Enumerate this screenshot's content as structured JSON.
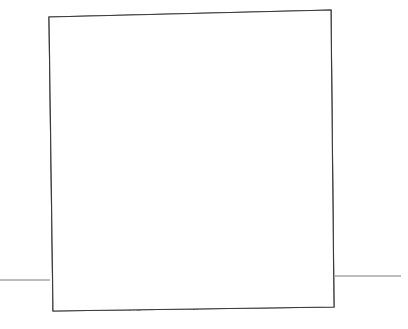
{
  "drawing": {
    "title": "Perspective line sketch of a two-part wall panel",
    "description": "Freehand technical sketch: an upright rectangular panel drawn in slight perspective. The left half is filled with dense random stipple texture; the right half is left blank white. A vertical double line divides the two halves. Short horizontal ground lines extend from the lower left and lower right corners.",
    "medium": "pen-and-ink line drawing",
    "background_color": "#ffffff",
    "line_color": "#3a3a3a",
    "stipple_color": "#333333",
    "ground_line_color": "#7a7a7a",
    "canvas": {
      "width": 408,
      "height": 329
    }
  },
  "elements": {
    "panel_outline": {
      "name": "panel-outline",
      "top_left": {
        "x": 49,
        "y": 17
      },
      "top_right": {
        "x": 331,
        "y": 10
      },
      "bottom_right": {
        "x": 334,
        "y": 307
      },
      "bottom_left": {
        "x": 53,
        "y": 311
      }
    },
    "divider": {
      "name": "vertical-divider",
      "top": {
        "x": 183,
        "y": 13
      },
      "bottom": {
        "x": 194,
        "y": 310
      },
      "style": "double-line"
    },
    "stippled_face": {
      "name": "stippled-left-face",
      "fill_texture": "random stipple dots",
      "dot_count": 1050,
      "dot_size_px": "1 to 2"
    },
    "blank_face": {
      "name": "blank-right-face",
      "fill": "#ffffff"
    },
    "ground_line_left": {
      "name": "ground-line-left",
      "from": {
        "x": 0,
        "y": 280
      },
      "to": {
        "x": 50,
        "y": 280
      }
    },
    "ground_line_right": {
      "name": "ground-line-right",
      "from": {
        "x": 335,
        "y": 276
      },
      "to": {
        "x": 401,
        "y": 276
      }
    }
  }
}
